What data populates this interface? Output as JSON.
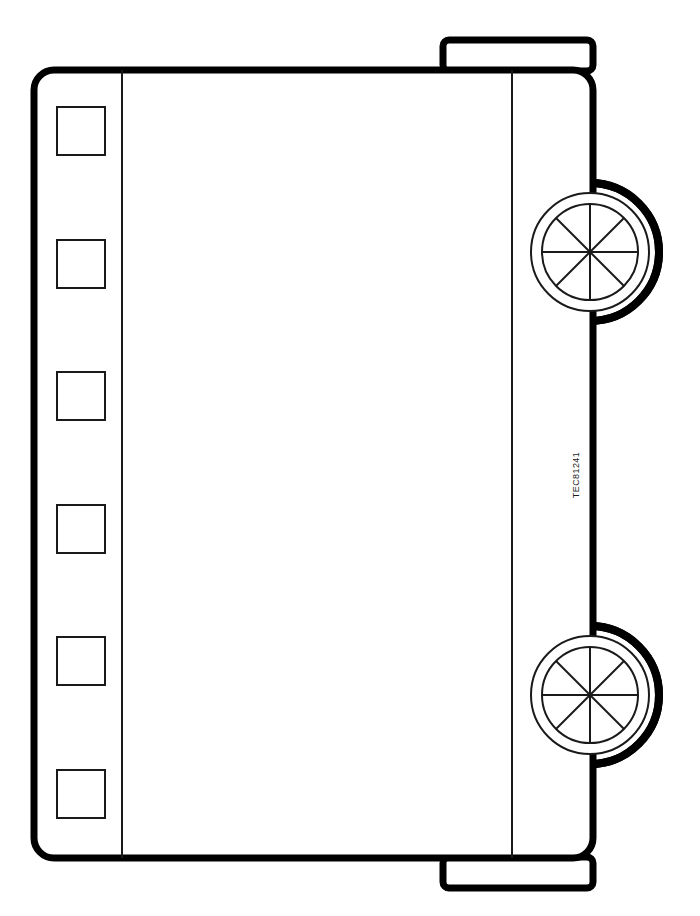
{
  "diagram": {
    "view": "side elevation",
    "background_color": "#ffffff",
    "line_color": "#000000",
    "thin_line_color": "#1a1a1a",
    "canvas": {
      "width": 700,
      "height": 916
    },
    "body": {
      "name": "main-body-shell",
      "x": 34,
      "y": 70,
      "width": 559,
      "height": 788,
      "corner_radius": 20,
      "stroke_width": 7,
      "fill": "#ffffff"
    },
    "dividers": [
      {
        "name": "left-partition-line",
        "x": 122,
        "y1": 70,
        "y2": 858,
        "stroke_width": 2
      },
      {
        "name": "right-partition-line",
        "x": 512,
        "y1": 70,
        "y2": 858,
        "stroke_width": 2
      }
    ],
    "window_panels": {
      "count": 6,
      "width": 48,
      "height": 48,
      "x": 57,
      "stroke_width": 2,
      "y_positions": [
        107,
        240,
        372,
        505,
        637,
        770
      ],
      "labels": [
        "window-panel-1",
        "window-panel-2",
        "window-panel-3",
        "window-panel-4",
        "window-panel-5",
        "window-panel-6"
      ]
    },
    "protrusions": [
      {
        "name": "top-coupler-plate",
        "x": 443,
        "y": 40,
        "width": 150,
        "height": 31,
        "corner_radius": 6,
        "stroke_width": 7
      },
      {
        "name": "bottom-coupler-plate",
        "x": 443,
        "y": 857,
        "width": 150,
        "height": 31,
        "corner_radius": 6,
        "stroke_width": 7
      }
    ],
    "wheels": [
      {
        "name": "wheel-upper",
        "cx": 590,
        "cy": 252,
        "outer_radius": 69,
        "tyre_radius": 59,
        "hub_radius": 48,
        "spokes": 8,
        "outer_stroke_width": 8,
        "inner_stroke_width": 2
      },
      {
        "name": "wheel-lower",
        "cx": 590,
        "cy": 695,
        "outer_radius": 69,
        "tyre_radius": 59,
        "hub_radius": 48,
        "spokes": 8,
        "outer_stroke_width": 8,
        "inner_stroke_width": 2
      }
    ],
    "annotations": [
      {
        "name": "part-number-label",
        "text": "TEC81241",
        "x": 577,
        "y": 475,
        "rotation": -90,
        "font_size": 9
      }
    ]
  }
}
